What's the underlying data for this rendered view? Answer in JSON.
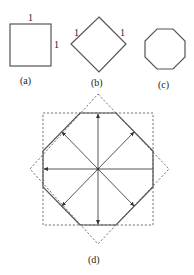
{
  "figure": {
    "panels": [
      {
        "id": "a",
        "caption": "(a)",
        "shape": "square",
        "side_labels": [
          "1",
          "1"
        ]
      },
      {
        "id": "b",
        "caption": "(b)",
        "shape": "diamond",
        "side_labels": [
          "1",
          "1"
        ]
      },
      {
        "id": "c",
        "caption": "(c)",
        "shape": "octagon"
      },
      {
        "id": "d",
        "caption": "(d)",
        "shape": "octagon-with-square-and-diamond-overlay",
        "arrows": 8
      }
    ]
  },
  "colors": {
    "stroke": "#555555",
    "dashed": "#666666",
    "text": "#222222",
    "background": "#ffffff"
  }
}
